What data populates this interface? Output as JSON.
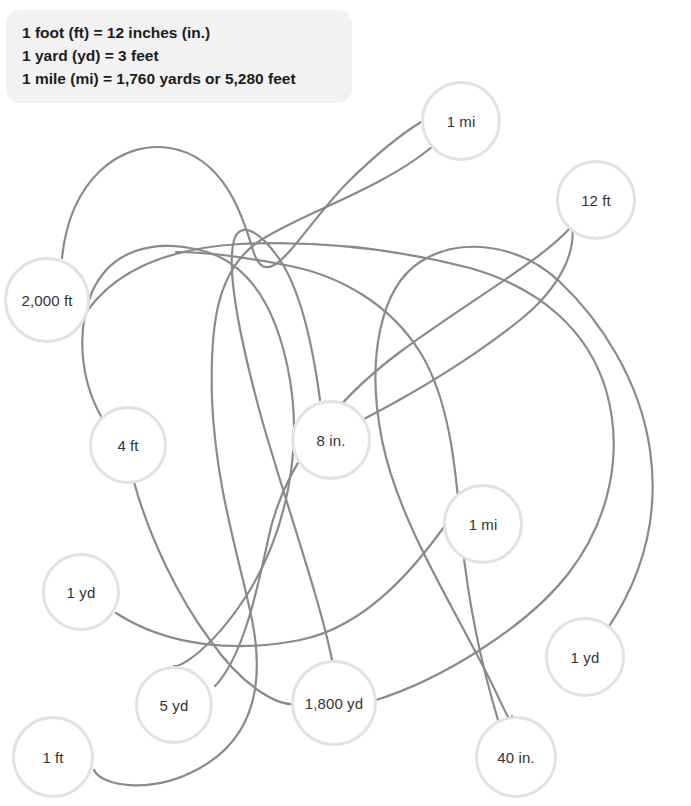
{
  "page": {
    "width": 691,
    "height": 806,
    "background_color": "#ffffff"
  },
  "legend": {
    "name": "conversion-reference-box",
    "background_color": "#f2f2f2",
    "text_color": "#1c1c1c",
    "lines": [
      "1 foot (ft) = 12 inches (in.)",
      "1 yard (yd) = 3 feet",
      "1 mile (mi) = 1,760 yards or 5,280 feet"
    ]
  },
  "style": {
    "node_fill": "#ffffff",
    "node_border": "#e2e2e2",
    "node_border_width": 3,
    "node_text_color": "#333333",
    "line_color": "#8a8a8a",
    "line_width": 2.2
  },
  "nodes": [
    {
      "id": "n-1mi-top",
      "label": "1 mi",
      "cx": 461,
      "cy": 121,
      "r": 40
    },
    {
      "id": "n-12ft",
      "label": "12 ft",
      "cx": 596,
      "cy": 200,
      "r": 40
    },
    {
      "id": "n-2000ft",
      "label": "2,000 ft",
      "cx": 47,
      "cy": 300,
      "r": 43
    },
    {
      "id": "n-4ft",
      "label": "4 ft",
      "cx": 128,
      "cy": 445,
      "r": 39
    },
    {
      "id": "n-8in",
      "label": "8 in.",
      "cx": 331,
      "cy": 440,
      "r": 40
    },
    {
      "id": "n-1mi-mid",
      "label": "1 mi",
      "cx": 483,
      "cy": 524,
      "r": 40
    },
    {
      "id": "n-1yd-left",
      "label": "1 yd",
      "cx": 81,
      "cy": 592,
      "r": 39
    },
    {
      "id": "n-1yd-right",
      "label": "1 yd",
      "cx": 585,
      "cy": 657,
      "r": 40
    },
    {
      "id": "n-5yd",
      "label": "5 yd",
      "cx": 174,
      "cy": 705,
      "r": 39
    },
    {
      "id": "n-1800yd",
      "label": "1,800 yd",
      "cx": 334,
      "cy": 703,
      "r": 43
    },
    {
      "id": "n-40in",
      "label": "40 in.",
      "cx": 516,
      "cy": 757,
      "r": 41
    },
    {
      "id": "n-1ft",
      "label": "1 ft",
      "cx": 53,
      "cy": 757,
      "r": 41
    }
  ],
  "connections": [
    {
      "id": "c-2000ft-1mitop",
      "from": "2,000 ft",
      "to": "1 mi",
      "path": "M 62 258 C 70 180 120 140 170 148 C 230 158 246 230 253 250 C 268 300 300 230 350 180 C 385 146 408 130 421 122"
    },
    {
      "id": "c-1mitop-1ft",
      "from": "1 mi",
      "to": "1 ft",
      "path": "M 432 147 C 380 190 300 214 258 242 C 215 272 210 330 212 400 C 216 490 240 560 252 620 C 266 690 250 740 200 768 C 150 796 100 785 94 770"
    },
    {
      "id": "c-12ft-5yd",
      "from": "12 ft",
      "to": "5 yd",
      "path": "M 572 226 C 540 262 470 300 400 352 C 330 404 282 470 268 540 C 254 606 240 660 215 686"
    },
    {
      "id": "c-8in-12ft",
      "from": "8 in.",
      "to": "12 ft",
      "path": "M 362 420 C 420 390 470 360 520 320 C 560 288 576 252 572 226"
    },
    {
      "id": "c-4ft-1800yd",
      "from": "4 ft",
      "to": "1,800 yd",
      "path": "M 134 482 C 150 540 180 600 210 640 C 245 690 280 706 295 704"
    },
    {
      "id": "c-1ydleft-1midd",
      "from": "1 yd",
      "to": "1 mi",
      "path": "M 116 613 C 170 648 240 652 300 640 C 370 626 420 560 444 527"
    },
    {
      "id": "c-1ydright-40in",
      "from": "1 yd",
      "to": "40 in.",
      "path": "M 608 628 C 640 580 660 520 650 450 C 640 380 600 320 560 282 C 520 244 460 236 420 262 C 380 288 366 360 382 440 C 398 520 450 600 490 680 C 508 716 512 730 512 716"
    },
    {
      "id": "c-2000ft-long",
      "from": "2,000 ft",
      "to": "1,800 yd",
      "path": "M 80 322 C 110 270 170 248 240 244 C 320 240 400 250 470 268 C 540 288 588 330 606 390 C 624 452 610 520 568 574 C 526 628 440 680 376 700"
    },
    {
      "id": "c-4ft-5yd-cross",
      "from": "4 ft",
      "to": "5 yd",
      "path": "M 102 418 C 80 380 76 330 92 292 C 110 252 150 238 200 250 C 250 262 278 310 290 380 C 302 452 286 530 250 590 C 214 648 180 668 174 666"
    },
    {
      "id": "c-8in-1800yd",
      "from": "8 in.",
      "to": "1,800 yd",
      "path": "M 320 400 C 312 340 300 290 280 260 C 258 228 240 222 234 240 C 226 270 240 340 262 420 C 288 510 320 600 332 660"
    },
    {
      "id": "c-40in-center",
      "from": "40 in.",
      "to": "center-web",
      "path": "M 498 720 C 480 660 468 600 462 540 C 456 470 450 400 420 352 C 390 304 340 276 290 266 C 240 256 200 252 176 252"
    }
  ],
  "activity": {
    "instruction_implied": "Trace each line to match equivalent measurements",
    "node_count": 12,
    "pair_count": 6
  }
}
